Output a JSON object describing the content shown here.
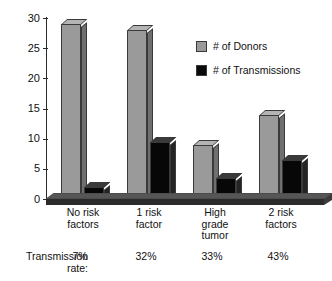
{
  "chart_data": {
    "type": "bar",
    "title": "",
    "subtitle": "",
    "xlabel": "",
    "ylabel": "",
    "ylim": [
      0,
      30
    ],
    "yticks": [
      0,
      5,
      10,
      15,
      20,
      25,
      30
    ],
    "ytick_labels": [
      "0",
      "5",
      "10",
      "15",
      "20",
      "25",
      "30"
    ],
    "grid": false,
    "legend_position": "upper-right-inside",
    "categories": [
      "No risk factors",
      "1 risk factor",
      "High grade tumor",
      "2 risk factors"
    ],
    "category_lines": [
      [
        "No risk",
        "factors"
      ],
      [
        "1 risk",
        "factor"
      ],
      [
        "High",
        "grade",
        "tumor"
      ],
      [
        "2 risk",
        "factors"
      ]
    ],
    "series": [
      {
        "name": "# of Donors",
        "color": "#9a9a9a",
        "values": [
          29,
          28,
          9,
          14
        ]
      },
      {
        "name": "# of Transmissions",
        "color": "#0a0a0a",
        "values": [
          2,
          9.5,
          3.5,
          6.5
        ]
      }
    ],
    "annotations": {
      "rate_caption_line1": "Transmission",
      "rate_caption_line2": "rate:",
      "rate_values": [
        "7%",
        "32%",
        "33%",
        "43%"
      ]
    }
  },
  "legend": {
    "items": [
      {
        "label": "# of Donors",
        "swatch": "gray"
      },
      {
        "label": "# of Transmissions",
        "swatch": "black"
      }
    ]
  },
  "colors": {
    "donors": "#9a9a9a",
    "transmissions": "#0a0a0a",
    "axis": "#2b2b2b",
    "background": "#ffffff"
  }
}
